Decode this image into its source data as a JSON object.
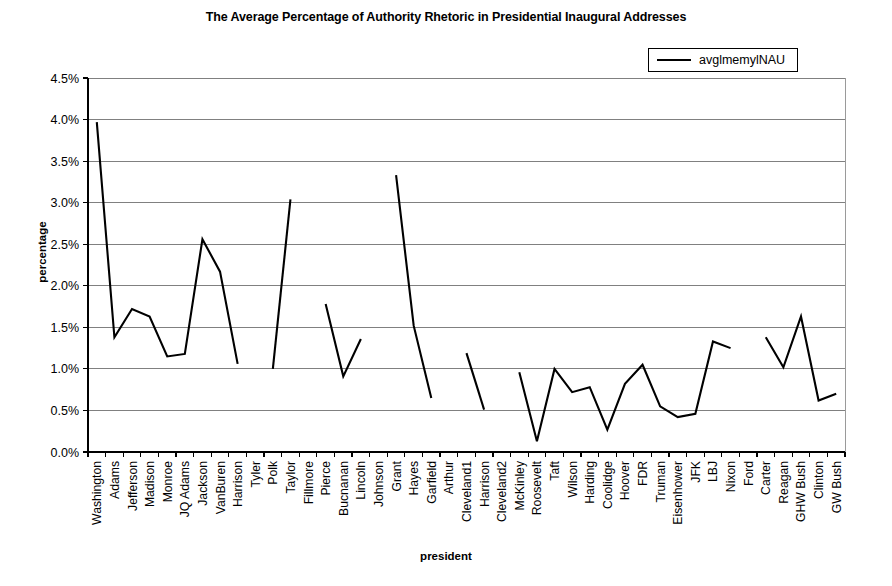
{
  "chart_data": {
    "type": "line",
    "title": "The Average Percentage of Authority Rhetoric in Presidential Inaugural Addresses",
    "xlabel": "president",
    "ylabel": "percentage",
    "grid": true,
    "legend_position": "top-right",
    "legend": [
      "avglmemylNAU"
    ],
    "ylim": [
      0,
      4.5
    ],
    "ytick_labels": [
      "0.0%",
      "0.5%",
      "1.0%",
      "1.5%",
      "2.0%",
      "2.5%",
      "3.0%",
      "3.5%",
      "4.0%",
      "4.5%"
    ],
    "ytick_values": [
      0,
      0.5,
      1.0,
      1.5,
      2.0,
      2.5,
      3.0,
      3.5,
      4.0,
      4.5
    ],
    "categories": [
      "Washington",
      "Adams",
      "Jefferson",
      "Madison",
      "Monroe",
      "JQ Adams",
      "Jackson",
      "VanBuren",
      "Harrison",
      "Tyler",
      "Polk",
      "Taylor",
      "Fillmore",
      "Pierce",
      "Bucnanan",
      "Lincoln",
      "Johnson",
      "Grant",
      "Hayes",
      "Garfield",
      "Arthur",
      "Cleveland1",
      "Harrison",
      "Cleveland2",
      "McKinley",
      "Roosevelt",
      "Taft",
      "Wilson",
      "Harding",
      "Coolidge",
      "Hoover",
      "FDR",
      "Truman",
      "Eisenhower",
      "JFK",
      "LBJ",
      "Nixon",
      "Ford",
      "Carter",
      "Reagan",
      "GHW Bush",
      "Clinton",
      "GW Bush"
    ],
    "series": [
      {
        "name": "avglmemylNAU",
        "values": [
          3.97,
          1.38,
          1.72,
          1.63,
          1.15,
          1.18,
          2.56,
          2.17,
          1.06,
          null,
          1.0,
          3.04,
          null,
          1.78,
          0.91,
          1.36,
          null,
          3.33,
          1.52,
          0.65,
          null,
          1.19,
          0.51,
          null,
          0.96,
          0.13,
          1.0,
          0.72,
          0.78,
          0.27,
          0.82,
          1.05,
          0.55,
          0.42,
          0.46,
          1.33,
          1.25,
          null,
          1.38,
          1.02,
          1.63,
          0.62,
          0.7
        ]
      }
    ],
    "colors": {
      "series_line": "#000000",
      "gridline": "#808080",
      "axis": "#000000",
      "background": "#ffffff"
    }
  }
}
